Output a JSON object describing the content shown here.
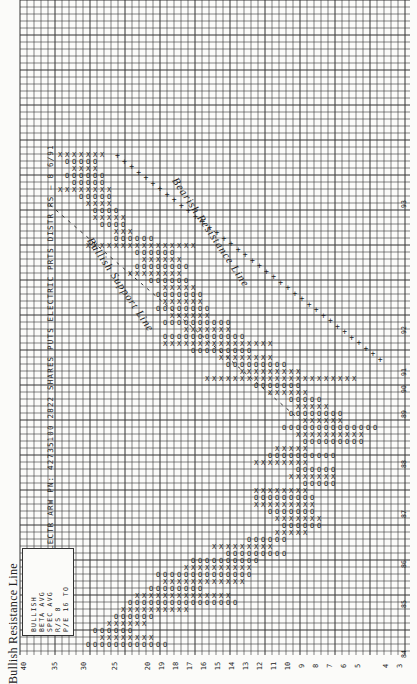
{
  "header": {
    "title": "Bullish Resistance Line",
    "ticker_line": "ARROW ELECTR  ARW  PN: 42735100   2822  SHARES  PUTS  ELECTRIC PRTS DISTR  RS – 8   6/91"
  },
  "legend": {
    "lines": [
      "BULLISH",
      "BETA AVG",
      "SPEC AVG",
      "R/S 8",
      "P/E 16 TO"
    ]
  },
  "annotations": {
    "upper": "Bearish Resistance Line",
    "lower": "Bullish Support Line"
  },
  "chart_data": {
    "type": "table",
    "subtype": "point-and-figure",
    "orientation": "rotated 90deg: price axis along bottom, time runs bottom-to-top",
    "price_axis_labels": [
      "40",
      "35",
      "30",
      "25",
      "20",
      "19",
      "18",
      "17",
      "16",
      "15",
      "14",
      "13",
      "12",
      "11",
      "10",
      "9",
      "8",
      "7",
      "6",
      "5",
      "4",
      "3"
    ],
    "year_markers": [
      "93",
      "92",
      "91",
      "90",
      "89",
      "88",
      "87",
      "86",
      "85",
      "84"
    ],
    "symbols": {
      "X": "rising",
      "O": "falling",
      "+": "trend line"
    },
    "trend_lines": [
      {
        "name": "Bearish Resistance Line",
        "style": "plus"
      },
      {
        "name": "Bullish Support Line",
        "style": "dashed"
      }
    ],
    "grid": true,
    "cell_px": 7
  }
}
